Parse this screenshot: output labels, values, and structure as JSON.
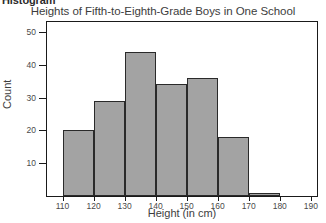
{
  "section_heading": "Histogram",
  "chart_data": {
    "type": "bar",
    "title": "Heights of Fifth-to-Eighth-Grade Boys in One School",
    "xlabel": "Height (in cm)",
    "ylabel": "Count",
    "grid": false,
    "legend": false,
    "xlim": [
      105,
      192
    ],
    "ylim": [
      0,
      53
    ],
    "bin_width": 10,
    "bin_edges": [
      110,
      120,
      130,
      140,
      150,
      160,
      170,
      180
    ],
    "categories": [
      "110-120",
      "120-130",
      "130-140",
      "140-150",
      "150-160",
      "160-170",
      "170-180"
    ],
    "values": [
      20,
      29,
      44,
      34,
      36,
      18,
      1
    ],
    "xticks": [
      110,
      120,
      130,
      140,
      150,
      160,
      170,
      180,
      190
    ],
    "xticklabels": [
      "110",
      "120",
      "130",
      "140",
      "150",
      "160",
      "170",
      "180",
      "190"
    ],
    "yticks": [
      10,
      20,
      30,
      40,
      50
    ],
    "yticklabels": [
      "10",
      "20",
      "30",
      "40",
      "50"
    ],
    "bar_fill_color": "#a3a3a3",
    "bar_edge_color": "#2a2a2a",
    "axis_color": "#1a1a1a",
    "background_color": "#ffffff"
  }
}
